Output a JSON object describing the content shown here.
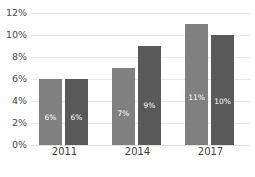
{
  "chart_data": {
    "type": "bar",
    "title": "",
    "subtitle": "",
    "xlabel": "",
    "ylabel": "",
    "categories": [
      "2011",
      "2014",
      "2017"
    ],
    "series": [
      {
        "name": "Series 1",
        "color": "#808080",
        "values": [
          6,
          7,
          11
        ],
        "labels": [
          "6%",
          "7%",
          "11%"
        ]
      },
      {
        "name": "Series 2",
        "color": "#595959",
        "values": [
          6,
          9,
          10
        ],
        "labels": [
          "6%",
          "9%",
          "10%"
        ]
      }
    ],
    "ylim": [
      0,
      12
    ],
    "ytick_values": [
      0,
      2,
      4,
      6,
      8,
      10,
      12
    ],
    "ytick_labels": [
      "0%",
      "2%",
      "4%",
      "6%",
      "8%",
      "10%",
      "12%"
    ],
    "grid": true,
    "grid_color": "#e9e9e9",
    "legend": false,
    "legend_position": "none",
    "data_labels_inside": true,
    "data_label_color": "#ffffff",
    "axis_text_color": "#4a4a4a",
    "background": "#ffffff"
  }
}
